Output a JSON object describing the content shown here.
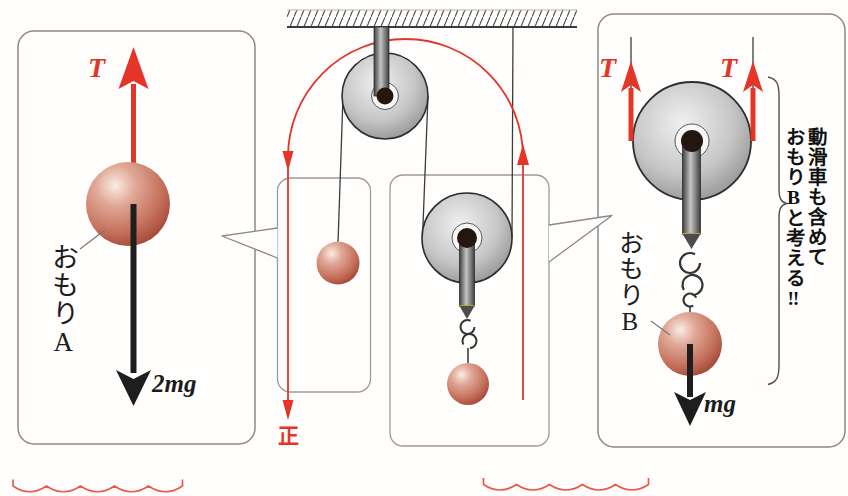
{
  "figure": {
    "kind": "physics-pulley-diagram",
    "accent_color": "#e53528",
    "left_panel": {
      "tension_label": "T",
      "object_label": "おもりA",
      "gravity_label": "2mg"
    },
    "center": {
      "positive_direction_label": "正"
    },
    "right_panel": {
      "tension_label_left": "T",
      "tension_label_right": "T",
      "object_label": "おもりB",
      "gravity_label": "mg",
      "note_line1": "動滑車も含めて",
      "note_line2": "おもりBと考える‼"
    }
  }
}
